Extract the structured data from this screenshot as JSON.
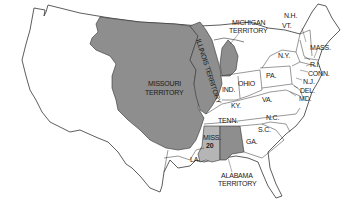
{
  "map": {
    "colors": {
      "background": "#ffffff",
      "outline": "#333333",
      "territory_shade": "#8e8e8e",
      "new_state_shade": "#b5b5b5",
      "unshaded": "#ffffff"
    },
    "labels": {
      "missouri_territory": [
        "MISSOURI",
        "TERRITORY"
      ],
      "illinois_territory": "ILLINOIS TERRITORY",
      "michigan_territory": [
        "MICHIGAN",
        "TERRITORY"
      ],
      "alabama_territory": [
        "ALABAMA",
        "TERRITORY"
      ],
      "mississippi": "MISS.",
      "mississippi_number": "20",
      "louisiana": "LA.",
      "tennessee": "TENN.",
      "kentucky": "KY.",
      "indiana": "IND.",
      "ohio": "OHIO",
      "pennsylvania": "PA.",
      "new_york": "N.Y.",
      "vermont": "VT.",
      "new_hampshire": "N.H.",
      "massachusetts": "MASS.",
      "rhode_island": "R.I.",
      "connecticut": "CONN.",
      "new_jersey": "N.J.",
      "delaware": "DEL.",
      "maryland": "MD.",
      "virginia": "VA.",
      "north_carolina": "N.C.",
      "south_carolina": "S.C.",
      "georgia": "GA."
    }
  }
}
